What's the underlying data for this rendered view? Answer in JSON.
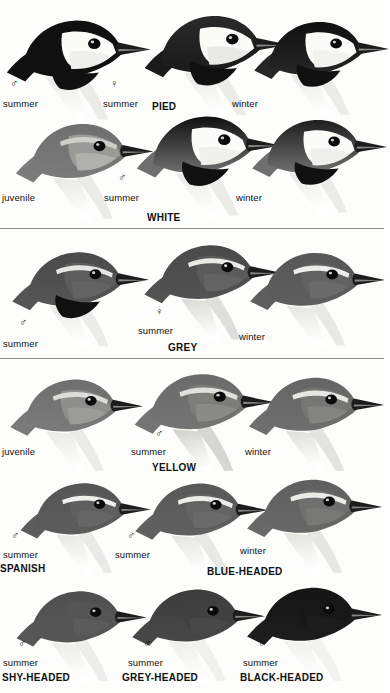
{
  "plate": {
    "title": "Wagtail head plate",
    "symbols": {
      "male": "♂",
      "female": "♀"
    },
    "captions": {
      "summer": "summer",
      "winter": "winter",
      "juvenile": "juvenile"
    },
    "colors": {
      "ink": "#111111",
      "rule": "#8d8d8d",
      "paper": "#fdfdfb",
      "black": "#101010",
      "dark_grey": "#4a4a4a",
      "mid_grey": "#6f6f6f",
      "light_grey": "#a8a8a8",
      "pale": "#e8e8e4",
      "white": "#fbfbf8"
    },
    "bands": [
      {
        "name": "pied-white-band",
        "species": [
          {
            "name": "PIED",
            "label_x": 152,
            "label_y": 101
          },
          {
            "name": "WHITE",
            "label_x": 147,
            "label_y": 212
          }
        ],
        "figures": [
          {
            "id": "pied-male-summer",
            "sex": "♂",
            "caption": "summer",
            "sym_x": 10,
            "sym_y": 78,
            "cap_x": 3,
            "cap_y": 98
          },
          {
            "id": "pied-female-summer",
            "sex": "♀",
            "caption": "summer",
            "sym_x": 110,
            "sym_y": 78,
            "cap_x": 103,
            "cap_y": 98
          },
          {
            "id": "pied-winter",
            "sex": "",
            "caption": "winter",
            "sym_x": 0,
            "sym_y": 0,
            "cap_x": 232,
            "cap_y": 98
          },
          {
            "id": "white-juvenile",
            "sex": "",
            "caption": "juvenile",
            "sym_x": 0,
            "sym_y": 0,
            "cap_x": 2,
            "cap_y": 192
          },
          {
            "id": "white-male-summer",
            "sex": "♂",
            "caption": "summer",
            "sym_x": 118,
            "sym_y": 172,
            "cap_x": 104,
            "cap_y": 192
          },
          {
            "id": "white-winter",
            "sex": "",
            "caption": "winter",
            "sym_x": 0,
            "sym_y": 0,
            "cap_x": 236,
            "cap_y": 192
          }
        ]
      },
      {
        "name": "grey-band",
        "species": [
          {
            "name": "GREY",
            "label_x": 168,
            "label_y": 342
          }
        ],
        "figures": [
          {
            "id": "grey-male-summer",
            "sex": "♂",
            "caption": "summer",
            "sym_x": 19,
            "sym_y": 317,
            "cap_x": 3,
            "cap_y": 338
          },
          {
            "id": "grey-female-summer",
            "sex": "♀",
            "caption": "summer",
            "sym_x": 155,
            "sym_y": 306,
            "cap_x": 138,
            "cap_y": 325
          },
          {
            "id": "grey-winter",
            "sex": "",
            "caption": "winter",
            "sym_x": 0,
            "sym_y": 0,
            "cap_x": 239,
            "cap_y": 331
          }
        ]
      },
      {
        "name": "yellow-band",
        "species": [
          {
            "name": "YELLOW",
            "label_x": 152,
            "label_y": 462
          }
        ],
        "figures": [
          {
            "id": "yellow-juvenile",
            "sex": "",
            "caption": "juvenile",
            "sym_x": 0,
            "sym_y": 0,
            "cap_x": 2,
            "cap_y": 446
          },
          {
            "id": "yellow-male-summer",
            "sex": "♂",
            "caption": "summer",
            "sym_x": 155,
            "sym_y": 428,
            "cap_x": 131,
            "cap_y": 446
          },
          {
            "id": "yellow-winter",
            "sex": "",
            "caption": "winter",
            "sym_x": 0,
            "sym_y": 0,
            "cap_x": 245,
            "cap_y": 446
          }
        ]
      },
      {
        "name": "spanish-blueheaded-band",
        "species": [
          {
            "name": "SPANISH",
            "label_x": 0,
            "label_y": 563
          },
          {
            "name": "BLUE-HEADED",
            "label_x": 207,
            "label_y": 566
          }
        ],
        "figures": [
          {
            "id": "spanish-male-summer",
            "sex": "♂",
            "caption": "summer",
            "sym_x": 11,
            "sym_y": 530,
            "cap_x": 3,
            "cap_y": 549
          },
          {
            "id": "blueheaded-male-summer",
            "sex": "♂",
            "caption": "summer",
            "sym_x": 127,
            "sym_y": 530,
            "cap_x": 115,
            "cap_y": 549
          },
          {
            "id": "blueheaded-winter",
            "sex": "",
            "caption": "winter",
            "sym_x": 0,
            "sym_y": 0,
            "cap_x": 240,
            "cap_y": 545
          }
        ]
      },
      {
        "name": "headed-forms-band",
        "species": [
          {
            "name": "SHY-HEADED",
            "label_x": 2,
            "label_y": 672
          },
          {
            "name": "GREY-HEADED",
            "label_x": 122,
            "label_y": 672
          },
          {
            "name": "BLACK-HEADED",
            "label_x": 240,
            "label_y": 672
          }
        ],
        "figures": [
          {
            "id": "ashyheaded-male-summer",
            "sex": "♂",
            "caption": "summer",
            "sym_x": 18,
            "sym_y": 638,
            "cap_x": 3,
            "cap_y": 657
          },
          {
            "id": "greyheaded-male-summer",
            "sex": "♂",
            "caption": "summer",
            "sym_x": 143,
            "sym_y": 638,
            "cap_x": 128,
            "cap_y": 657
          },
          {
            "id": "blackheaded-male-summer",
            "sex": "♂",
            "caption": "summer",
            "sym_x": 258,
            "sym_y": 638,
            "cap_x": 243,
            "cap_y": 657
          }
        ]
      }
    ],
    "rules": [
      {
        "name": "rule-after-white",
        "y": 228
      },
      {
        "name": "rule-after-grey",
        "y": 358
      }
    ]
  }
}
